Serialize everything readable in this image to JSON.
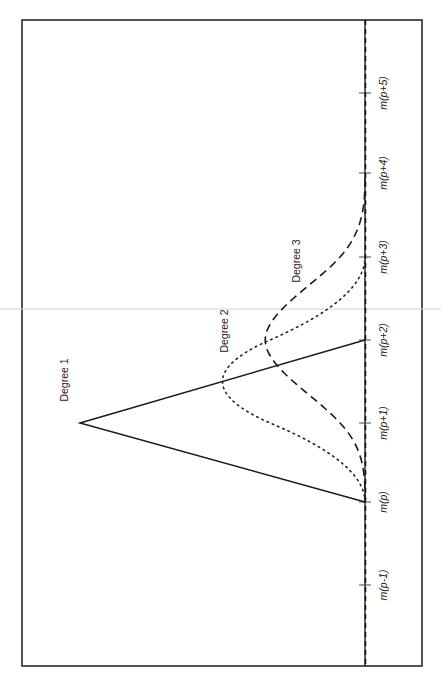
{
  "chart_data": {
    "type": "line",
    "title": "",
    "xlabel": "",
    "ylabel": "",
    "orientation": "rotated 90° counter-clockwise (x-axis runs bottom-to-top along right side)",
    "grid": false,
    "legend": "inline labels",
    "knots": [
      "m(p-1)",
      "m(p)",
      "m(p+1)",
      "m(p+2)",
      "m(p+3)",
      "m(p+4)",
      "m(p+5)"
    ],
    "knot_positions": [
      -1,
      0,
      1,
      2,
      3,
      4,
      5
    ],
    "xlim": [
      -2,
      6
    ],
    "ylim": [
      0,
      1.05
    ],
    "series": [
      {
        "name": "Degree 1",
        "style": "solid",
        "support": [
          0,
          2
        ],
        "peak_x": 1,
        "peak_y": 1.0,
        "x": [
          -2,
          0,
          1,
          2,
          6
        ],
        "y": [
          0,
          0,
          1.0,
          0,
          0
        ]
      },
      {
        "name": "Degree 2",
        "style": "dotted",
        "support": [
          0,
          3
        ],
        "peak_x": 1.5,
        "peak_y": 0.5,
        "x": [
          0,
          0.5,
          1,
          1.5,
          2,
          2.5,
          3
        ],
        "y": [
          0,
          0.08,
          0.33,
          0.5,
          0.33,
          0.08,
          0
        ]
      },
      {
        "name": "Degree 3",
        "style": "dashed",
        "support": [
          0,
          4
        ],
        "peak_x": 2,
        "peak_y": 0.35,
        "x": [
          0,
          0.5,
          1,
          1.5,
          2,
          2.5,
          3,
          3.5,
          4
        ],
        "y": [
          0,
          0.011,
          0.088,
          0.241,
          0.35,
          0.241,
          0.088,
          0.011,
          0
        ]
      }
    ],
    "annotations": [
      {
        "text": "Degree 1",
        "near": "left leg of triangle"
      },
      {
        "text": "Degree 2",
        "near": "peak of dotted curve"
      },
      {
        "text": "Degree 3",
        "near": "right side of dashed curve"
      }
    ]
  },
  "layout": {
    "frame": {
      "left": 22,
      "top": 20,
      "right": 422,
      "bottom": 666
    },
    "baseline_x": 365,
    "unit_height_px": 285,
    "knot_px": [
      585,
      502,
      423,
      340,
      257,
      173,
      93
    ],
    "label_positions": {
      "Degree 1": {
        "x": 68,
        "y": 380
      },
      "Degree 2": {
        "x": 228,
        "y": 331
      },
      "Degree 3": {
        "x": 300,
        "y": 261
      }
    }
  }
}
